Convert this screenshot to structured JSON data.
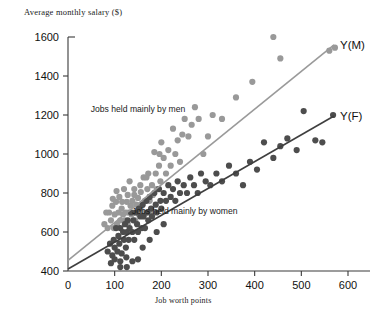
{
  "chart_data": {
    "type": "scatter",
    "title": "Average monthly salary ($)",
    "xlabel": "Job worth points",
    "ylabel": "Average monthly salary ($)",
    "xlim": [
      0,
      600
    ],
    "ylim": [
      400,
      1600
    ],
    "xticks": [
      0,
      100,
      200,
      300,
      400,
      500,
      600
    ],
    "yticks": [
      400,
      600,
      800,
      1000,
      1200,
      1400,
      1600
    ],
    "grid": false,
    "legend_position": "inline-annotations",
    "annotations": [
      {
        "text": "Jobs held mainly by men",
        "x": 150,
        "y": 1215
      },
      {
        "text": "Jobs held mainly by women",
        "x": 250,
        "y": 690
      }
    ],
    "series": [
      {
        "name": "Jobs held mainly by men",
        "label": "Y(M)",
        "color": "#999999",
        "line_color": "#9a9a9a",
        "line": {
          "x0": 0,
          "y0": 455,
          "x1": 570,
          "y1": 1560
        },
        "points": [
          [
            88,
            700
          ],
          [
            92,
            660
          ],
          [
            95,
            735
          ],
          [
            98,
            620
          ],
          [
            100,
            690
          ],
          [
            103,
            755
          ],
          [
            105,
            640
          ],
          [
            108,
            700
          ],
          [
            110,
            780
          ],
          [
            112,
            660
          ],
          [
            115,
            720
          ],
          [
            118,
            690
          ],
          [
            120,
            820
          ],
          [
            122,
            660
          ],
          [
            124,
            700
          ],
          [
            126,
            755
          ],
          [
            128,
            640
          ],
          [
            130,
            700
          ],
          [
            132,
            860
          ],
          [
            134,
            735
          ],
          [
            136,
            690
          ],
          [
            138,
            760
          ],
          [
            140,
            700
          ],
          [
            142,
            820
          ],
          [
            144,
            660
          ],
          [
            146,
            740
          ],
          [
            148,
            700
          ],
          [
            150,
            775
          ],
          [
            152,
            690
          ],
          [
            155,
            840
          ],
          [
            158,
            735
          ],
          [
            160,
            700
          ],
          [
            162,
            880
          ],
          [
            165,
            760
          ],
          [
            168,
            700
          ],
          [
            170,
            820
          ],
          [
            172,
            900
          ],
          [
            175,
            760
          ],
          [
            178,
            700
          ],
          [
            180,
            840
          ],
          [
            185,
            1010
          ],
          [
            188,
            900
          ],
          [
            190,
            820
          ],
          [
            195,
            940
          ],
          [
            198,
            860
          ],
          [
            200,
            1060
          ],
          [
            205,
            980
          ],
          [
            210,
            900
          ],
          [
            215,
            1020
          ],
          [
            220,
            940
          ],
          [
            225,
            1130
          ],
          [
            230,
            1000
          ],
          [
            235,
            1070
          ],
          [
            240,
            960
          ],
          [
            245,
            1100
          ],
          [
            250,
            1180
          ],
          [
            258,
            1090
          ],
          [
            265,
            1150
          ],
          [
            272,
            1240
          ],
          [
            280,
            1180
          ],
          [
            290,
            1000
          ],
          [
            300,
            1090
          ],
          [
            310,
            1200
          ],
          [
            330,
            1180
          ],
          [
            360,
            1290
          ],
          [
            395,
            1370
          ],
          [
            440,
            1600
          ],
          [
            455,
            1490
          ],
          [
            560,
            1530
          ],
          [
            572,
            1545
          ],
          [
            78,
            640
          ],
          [
            82,
            700
          ],
          [
            85,
            620
          ],
          [
            96,
            770
          ],
          [
            104,
            810
          ],
          [
            116,
            755
          ],
          [
            128,
            790
          ],
          [
            142,
            790
          ],
          [
            156,
            805
          ],
          [
            168,
            880
          ],
          [
            182,
            790
          ],
          [
            196,
            1000
          ]
        ]
      },
      {
        "name": "Jobs held mainly by women",
        "label": "Y(F)",
        "color": "#4d4d4d",
        "line_color": "#3f3f3f",
        "line": {
          "x0": 0,
          "y0": 410,
          "x1": 570,
          "y1": 1195
        },
        "points": [
          [
            85,
            500
          ],
          [
            90,
            540
          ],
          [
            95,
            480
          ],
          [
            98,
            560
          ],
          [
            100,
            520
          ],
          [
            103,
            620
          ],
          [
            106,
            500
          ],
          [
            108,
            580
          ],
          [
            110,
            540
          ],
          [
            112,
            620
          ],
          [
            115,
            490
          ],
          [
            118,
            600
          ],
          [
            120,
            560
          ],
          [
            122,
            640
          ],
          [
            124,
            520
          ],
          [
            126,
            600
          ],
          [
            128,
            660
          ],
          [
            130,
            560
          ],
          [
            132,
            620
          ],
          [
            135,
            700
          ],
          [
            138,
            600
          ],
          [
            140,
            660
          ],
          [
            142,
            560
          ],
          [
            145,
            700
          ],
          [
            148,
            640
          ],
          [
            150,
            600
          ],
          [
            152,
            720
          ],
          [
            155,
            680
          ],
          [
            158,
            620
          ],
          [
            160,
            740
          ],
          [
            162,
            680
          ],
          [
            165,
            620
          ],
          [
            168,
            760
          ],
          [
            170,
            700
          ],
          [
            172,
            660
          ],
          [
            175,
            780
          ],
          [
            178,
            720
          ],
          [
            180,
            680
          ],
          [
            185,
            800
          ],
          [
            188,
            740
          ],
          [
            190,
            700
          ],
          [
            195,
            820
          ],
          [
            198,
            760
          ],
          [
            200,
            720
          ],
          [
            205,
            800
          ],
          [
            210,
            760
          ],
          [
            215,
            840
          ],
          [
            220,
            780
          ],
          [
            225,
            820
          ],
          [
            230,
            760
          ],
          [
            235,
            860
          ],
          [
            240,
            800
          ],
          [
            248,
            840
          ],
          [
            255,
            800
          ],
          [
            262,
            880
          ],
          [
            270,
            840
          ],
          [
            278,
            800
          ],
          [
            285,
            900
          ],
          [
            295,
            860
          ],
          [
            305,
            840
          ],
          [
            318,
            900
          ],
          [
            330,
            860
          ],
          [
            345,
            940
          ],
          [
            360,
            900
          ],
          [
            375,
            840
          ],
          [
            390,
            960
          ],
          [
            405,
            920
          ],
          [
            420,
            1060
          ],
          [
            440,
            980
          ],
          [
            455,
            1040
          ],
          [
            470,
            1080
          ],
          [
            490,
            1020
          ],
          [
            505,
            1220
          ],
          [
            530,
            1070
          ],
          [
            545,
            1060
          ],
          [
            568,
            1200
          ],
          [
            92,
            440
          ],
          [
            100,
            460
          ],
          [
            112,
            450
          ],
          [
            125,
            470
          ],
          [
            138,
            450
          ],
          [
            150,
            460
          ],
          [
            112,
            420
          ],
          [
            126,
            420
          ],
          [
            160,
            520
          ],
          [
            175,
            560
          ],
          [
            190,
            600
          ],
          [
            205,
            640
          ]
        ]
      }
    ]
  }
}
